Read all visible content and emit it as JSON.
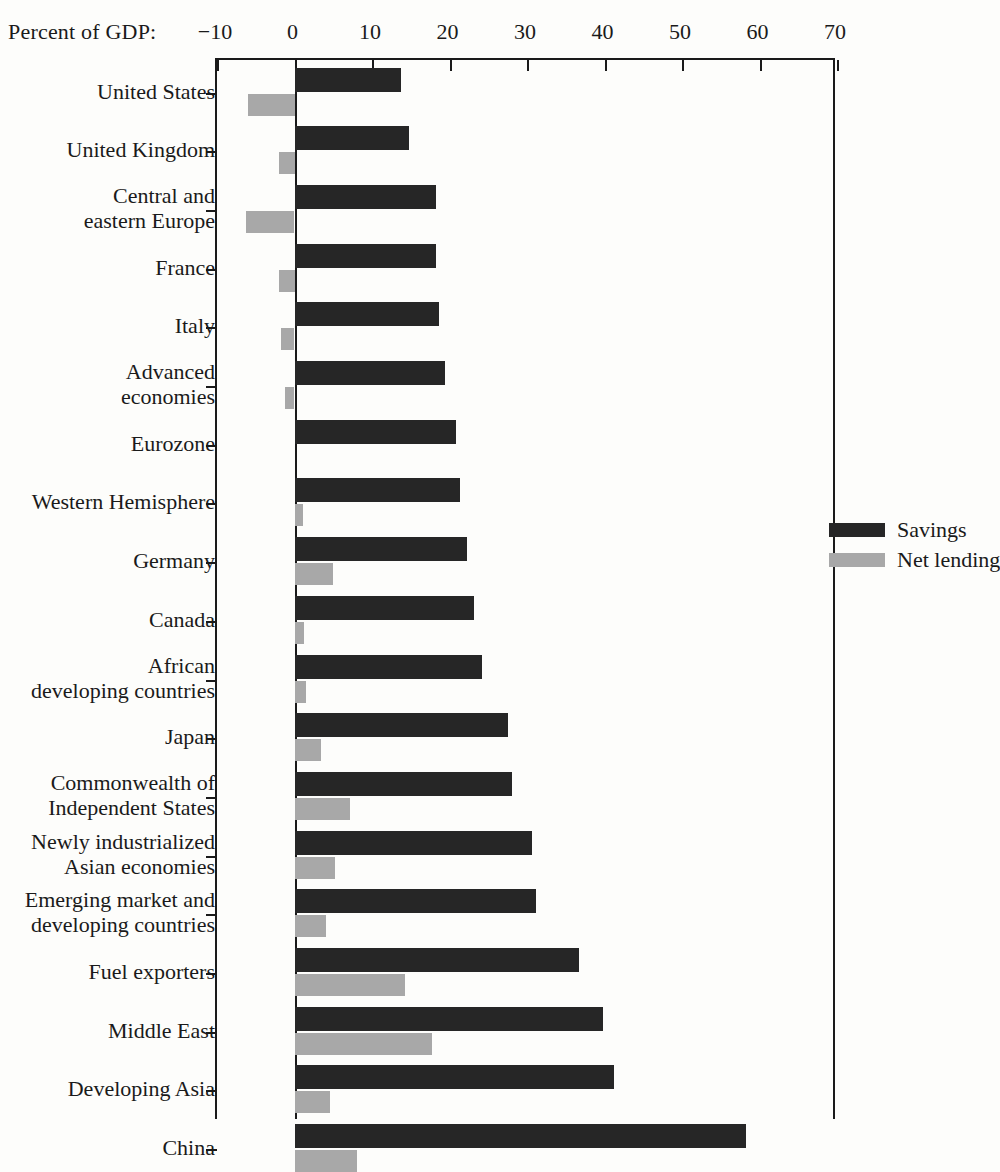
{
  "chart_data": {
    "type": "bar",
    "orientation": "horizontal",
    "title": "",
    "xlabel": "Percent of GDP:",
    "ylabel": "",
    "xlim": [
      -10,
      70
    ],
    "xticks": [
      -10,
      0,
      10,
      20,
      30,
      40,
      50,
      60,
      70
    ],
    "xtick_labels": [
      "−10",
      "0",
      "10",
      "20",
      "30",
      "40",
      "50",
      "60",
      "70"
    ],
    "grid": false,
    "legend_position": "upper right",
    "colors": {
      "savings": "#262626",
      "net_lending": "#a8a8a8",
      "axis": "#1a1a1a",
      "background": "#fdfdfb"
    },
    "categories": [
      "United States",
      "United Kingdom",
      "Central and\neastern Europe",
      "France",
      "Italy",
      "Advanced\neconomies",
      "Eurozone",
      "Western Hemisphere",
      "Germany",
      "Canada",
      "African\ndeveloping countries",
      "Japan",
      "Commonwealth of\nIndependent States",
      "Newly industrialized\nAsian economies",
      "Emerging market and\ndeveloping countries",
      "Fuel exporters",
      "Middle East",
      "Developing Asia",
      "China"
    ],
    "series": [
      {
        "name": "Savings",
        "color": "#262626",
        "values": [
          13.8,
          14.8,
          18.2,
          18.3,
          18.6,
          19.4,
          20.9,
          21.3,
          22.3,
          23.2,
          24.2,
          27.6,
          28.0,
          30.6,
          31.2,
          36.7,
          39.8,
          41.2,
          58.2
        ]
      },
      {
        "name": "Net lending",
        "color": "#a8a8a8",
        "values": [
          -6.0,
          -2.0,
          -6.3,
          -2.0,
          -1.8,
          -1.2,
          0.0,
          1.1,
          5.0,
          1.2,
          1.5,
          3.4,
          7.1,
          5.2,
          4.0,
          14.2,
          17.8,
          4.6,
          8.0
        ]
      }
    ]
  },
  "legend": {
    "items": [
      {
        "label": "Savings",
        "swatch": "savings"
      },
      {
        "label": "Net lending",
        "swatch": "netlend"
      }
    ]
  }
}
